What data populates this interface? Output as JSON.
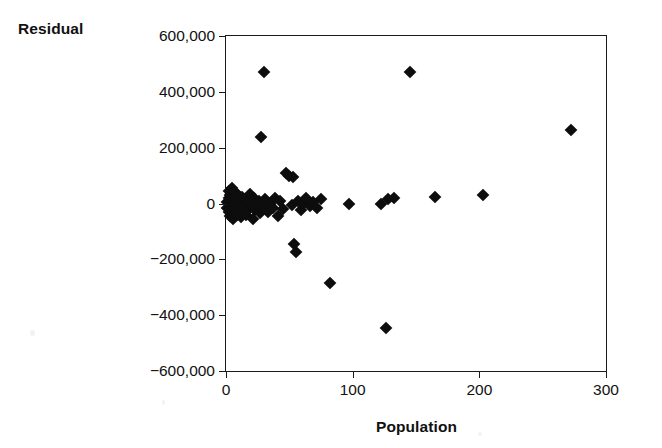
{
  "chart_data": {
    "type": "scatter",
    "title": "",
    "xlabel": "Population",
    "ylabel": "Residual",
    "xlim": [
      0,
      300
    ],
    "ylim": [
      -600000,
      600000
    ],
    "xticks": [
      0,
      100,
      200,
      300
    ],
    "yticks": [
      600000,
      400000,
      200000,
      0,
      -200000,
      -400000,
      -600000
    ],
    "xtick_labels": [
      "0",
      "100",
      "200",
      "300"
    ],
    "ytick_labels": [
      "600,000",
      "400,000",
      "200,000",
      "0",
      "−200,000",
      "−400,000",
      "−600,000"
    ],
    "grid": false,
    "legend": null,
    "marker": "filled-diamond",
    "marker_color": "#0d0d0d",
    "points": [
      {
        "x": 1,
        "y": 5000
      },
      {
        "x": 1,
        "y": -15000
      },
      {
        "x": 2,
        "y": 20000
      },
      {
        "x": 2,
        "y": -30000
      },
      {
        "x": 2.5,
        "y": 45000
      },
      {
        "x": 3,
        "y": -5000
      },
      {
        "x": 3,
        "y": 30000
      },
      {
        "x": 3.5,
        "y": -45000
      },
      {
        "x": 4,
        "y": 10000
      },
      {
        "x": 4,
        "y": -25000
      },
      {
        "x": 4.5,
        "y": 55000
      },
      {
        "x": 5,
        "y": -10000
      },
      {
        "x": 5,
        "y": 25000
      },
      {
        "x": 5.5,
        "y": -55000
      },
      {
        "x": 6,
        "y": 0
      },
      {
        "x": 6.5,
        "y": -35000
      },
      {
        "x": 7,
        "y": 40000
      },
      {
        "x": 7,
        "y": -15000
      },
      {
        "x": 8,
        "y": 15000
      },
      {
        "x": 8.5,
        "y": -40000
      },
      {
        "x": 9,
        "y": -5000
      },
      {
        "x": 9.5,
        "y": 30000
      },
      {
        "x": 10,
        "y": -20000
      },
      {
        "x": 11,
        "y": 10000
      },
      {
        "x": 11.5,
        "y": -50000
      },
      {
        "x": 12,
        "y": 0
      },
      {
        "x": 13,
        "y": 25000
      },
      {
        "x": 13.5,
        "y": -30000
      },
      {
        "x": 14,
        "y": -10000
      },
      {
        "x": 15,
        "y": 15000
      },
      {
        "x": 16,
        "y": -40000
      },
      {
        "x": 17,
        "y": 5000
      },
      {
        "x": 18,
        "y": -20000
      },
      {
        "x": 19,
        "y": 35000
      },
      {
        "x": 20,
        "y": -5000
      },
      {
        "x": 21,
        "y": -55000
      },
      {
        "x": 22,
        "y": 20000
      },
      {
        "x": 23,
        "y": -25000
      },
      {
        "x": 24,
        "y": 0
      },
      {
        "x": 26,
        "y": 10000
      },
      {
        "x": 27,
        "y": -35000
      },
      {
        "x": 28,
        "y": 240000
      },
      {
        "x": 29,
        "y": -10000
      },
      {
        "x": 30,
        "y": 470000
      },
      {
        "x": 31,
        "y": 15000
      },
      {
        "x": 33,
        "y": -30000
      },
      {
        "x": 35,
        "y": 0
      },
      {
        "x": 37,
        "y": -15000
      },
      {
        "x": 39,
        "y": 20000
      },
      {
        "x": 41,
        "y": -45000
      },
      {
        "x": 43,
        "y": 10000
      },
      {
        "x": 45,
        "y": -20000
      },
      {
        "x": 47,
        "y": 110000
      },
      {
        "x": 50,
        "y": 100000
      },
      {
        "x": 53,
        "y": 95000
      },
      {
        "x": 52,
        "y": -5000
      },
      {
        "x": 54,
        "y": -145000
      },
      {
        "x": 55,
        "y": -175000
      },
      {
        "x": 57,
        "y": 10000
      },
      {
        "x": 59,
        "y": -25000
      },
      {
        "x": 61,
        "y": 0
      },
      {
        "x": 63,
        "y": 20000
      },
      {
        "x": 66,
        "y": -10000
      },
      {
        "x": 69,
        "y": 5000
      },
      {
        "x": 72,
        "y": -15000
      },
      {
        "x": 75,
        "y": 15000
      },
      {
        "x": 82,
        "y": -285000
      },
      {
        "x": 97,
        "y": 0
      },
      {
        "x": 122,
        "y": 0
      },
      {
        "x": 128,
        "y": 15000
      },
      {
        "x": 133,
        "y": 20000
      },
      {
        "x": 126,
        "y": -445000
      },
      {
        "x": 145,
        "y": 470000
      },
      {
        "x": 165,
        "y": 25000
      },
      {
        "x": 203,
        "y": 30000
      },
      {
        "x": 272,
        "y": 265000
      }
    ]
  }
}
